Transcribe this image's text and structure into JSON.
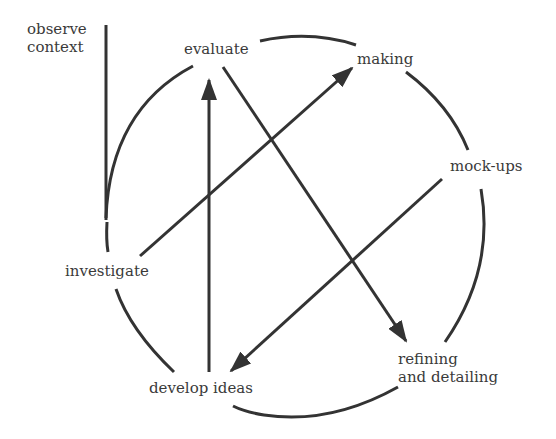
{
  "diagram": {
    "type": "design-process-cycle",
    "stroke_color": "#333333",
    "text_color": "#3a3a3a",
    "background": "#ffffff",
    "nodes": [
      {
        "id": "observe",
        "label_line1": "observe",
        "label_line2": "context"
      },
      {
        "id": "evaluate",
        "label": "evaluate"
      },
      {
        "id": "making",
        "label": "making"
      },
      {
        "id": "mockups",
        "label": "mock-ups"
      },
      {
        "id": "refining",
        "label_line1": "refining",
        "label_line2": "and detailing"
      },
      {
        "id": "develop",
        "label": "develop ideas"
      },
      {
        "id": "investigate",
        "label": "investigate"
      }
    ],
    "arrows": [
      {
        "from": "develop ideas",
        "to": "evaluate"
      },
      {
        "from": "investigate",
        "to": "making"
      },
      {
        "from": "evaluate",
        "to": "refining and detailing"
      },
      {
        "from": "mock-ups",
        "to": "develop ideas"
      }
    ],
    "cycle_order": [
      "evaluate",
      "making",
      "mock-ups",
      "refining and detailing",
      "develop ideas",
      "investigate"
    ]
  }
}
